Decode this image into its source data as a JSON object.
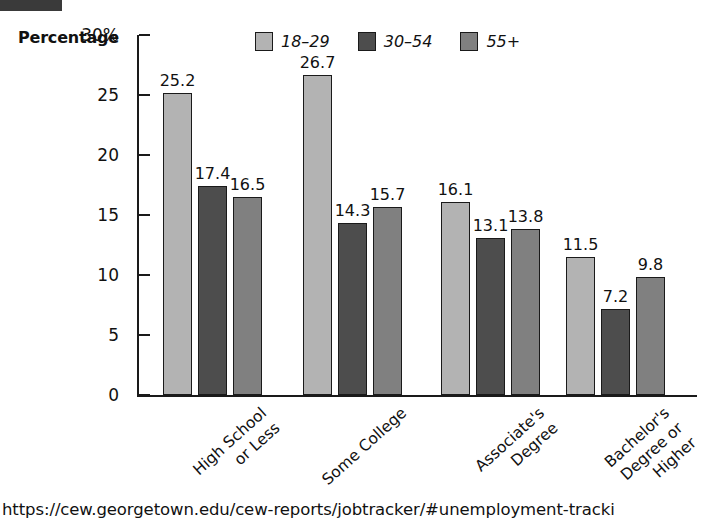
{
  "chart_data": {
    "type": "bar",
    "title": "",
    "ylabel": "Percentage",
    "xlabel": "",
    "ylim": [
      0,
      30
    ],
    "y_ticks": [
      "0",
      "5",
      "10",
      "15",
      "20",
      "25",
      "30%"
    ],
    "y_tick_values": [
      0,
      5,
      10,
      15,
      20,
      25,
      30
    ],
    "grid": false,
    "legend_position": "top-center",
    "categories": [
      "High School or Less",
      "Some College",
      "Associate's Degree",
      "Bachelor's Degree or Higher"
    ],
    "category_label_lines": [
      [
        "High School",
        "or Less"
      ],
      [
        "Some College"
      ],
      [
        "Associate's",
        "Degree"
      ],
      [
        "Bachelor's",
        "Degree or",
        "Higher"
      ]
    ],
    "series": [
      {
        "name": "18–29",
        "color": "#b3b3b3",
        "values": [
          25.2,
          26.7,
          16.1,
          11.5
        ]
      },
      {
        "name": "30–54",
        "color": "#4d4d4d",
        "values": [
          17.4,
          14.3,
          13.1,
          7.2
        ]
      },
      {
        "name": "55+",
        "color": "#808080",
        "values": [
          16.5,
          15.7,
          13.8,
          9.8
        ]
      }
    ],
    "value_labels": [
      [
        "25.2",
        "17.4",
        "16.5"
      ],
      [
        "26.7",
        "14.3",
        "15.7"
      ],
      [
        "16.1",
        "13.1",
        "13.8"
      ],
      [
        "11.5",
        "7.2",
        "9.8"
      ]
    ]
  },
  "legend": {
    "items": [
      {
        "label": "18–29",
        "color": "#b3b3b3"
      },
      {
        "label": "30–54",
        "color": "#4d4d4d"
      },
      {
        "label": "55+",
        "color": "#808080"
      }
    ]
  },
  "axis": {
    "y_title": "Percentage"
  },
  "footer": {
    "source_url": "https://cew.georgetown.edu/cew-reports/jobtracker/#unemployment-tracki"
  },
  "colors": {
    "axis": "#1a1a1a",
    "text": "#111111",
    "background": "#ffffff",
    "top_bar": "#3a3a3a"
  }
}
